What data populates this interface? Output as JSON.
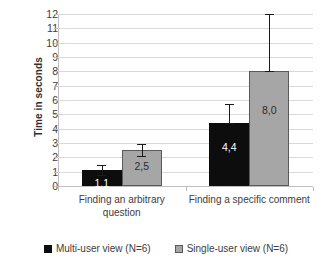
{
  "chart_data": {
    "type": "bar",
    "title": "",
    "xlabel": "",
    "ylabel": "Time in seconds",
    "ylim": [
      0,
      12
    ],
    "ytick_step": 1,
    "yticks": [
      "12",
      "11",
      "10",
      "9",
      "8",
      "7",
      "6",
      "5",
      "4",
      "3",
      "2",
      "1",
      "0"
    ],
    "grid": true,
    "legend_position": "bottom",
    "categories": [
      "Finding an arbitrary question",
      "Finding a specific comment"
    ],
    "category_lines": [
      [
        "Finding an arbitrary",
        "question"
      ],
      [
        "Finding a specific comment"
      ]
    ],
    "series": [
      {
        "name": "Multi-user view (N=6)",
        "color": "#0d0d0d",
        "values": [
          1.1,
          4.4
        ],
        "labels": [
          "1,1",
          "4,4"
        ],
        "error_low": [
          0.8,
          4.4
        ],
        "error_high": [
          1.5,
          5.7
        ]
      },
      {
        "name": "Single-user view (N=6)",
        "color": "#a6a6a6",
        "values": [
          2.5,
          8.0
        ],
        "labels": [
          "2,5",
          "8,0"
        ],
        "error_low": [
          2.1,
          8.0
        ],
        "error_high": [
          2.9,
          12.0
        ]
      }
    ]
  },
  "legend": {
    "items": [
      {
        "label": "Multi-user view (N=6)",
        "swatch": "multi"
      },
      {
        "label": "Single-user view (N=6)",
        "swatch": "single"
      }
    ]
  }
}
